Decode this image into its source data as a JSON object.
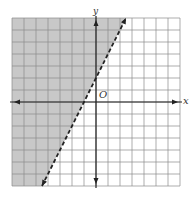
{
  "chart_data": {
    "type": "line",
    "title": "",
    "xlabel": "x",
    "ylabel": "y",
    "origin_label": "O",
    "xlim": [
      -7,
      7
    ],
    "ylim": [
      -7,
      7
    ],
    "grid": true,
    "grid_step": 1,
    "boundary": {
      "equation": "y = 2x + 2",
      "slope": 2,
      "intercept": 2,
      "style": "dashed",
      "points": [
        [
          -4.5,
          -7
        ],
        [
          -1,
          0
        ],
        [
          0,
          2
        ],
        [
          2.5,
          7
        ]
      ]
    },
    "inequality": "y > 2x + 2",
    "shaded_side": "left/above",
    "colors": {
      "shade": "#c8c8c8",
      "grid": "#8a8a8a",
      "axis": "#222222",
      "line": "#222222"
    }
  },
  "labels": {
    "x_axis": "x",
    "y_axis": "y",
    "origin": "O"
  }
}
